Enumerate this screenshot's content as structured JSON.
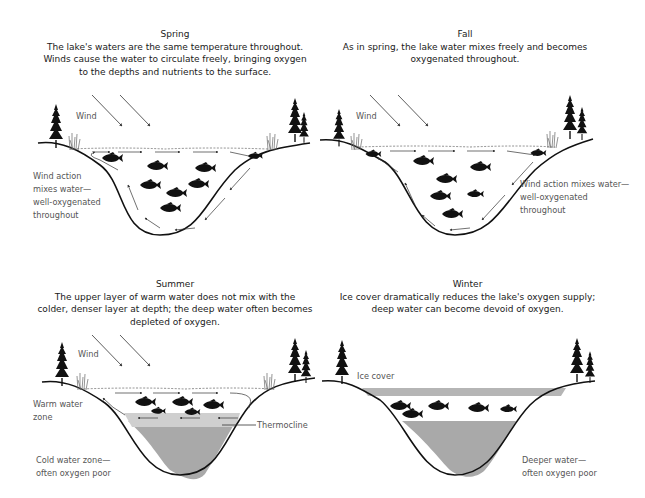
{
  "panels": {
    "spring": {
      "season": "Spring",
      "description_lines": [
        "The lake's waters are the same temperature throughout.",
        "Winds cause the water to circulate freely, bringing oxygen",
        "to the depths and nutrients to the surface."
      ],
      "wind_label": "Wind",
      "side_label_lines": [
        "Wind action",
        "mixes water—",
        "well-oxygenated",
        "throughout"
      ]
    },
    "fall": {
      "season": "Fall",
      "description_lines": [
        "As in spring, the lake water mixes freely and becomes",
        "oxygenated throughout."
      ],
      "wind_label": "Wind",
      "side_label_lines": [
        "Wind action mixes water—",
        "well-oxygenated",
        "throughout"
      ]
    },
    "summer": {
      "season": "Summer",
      "description_lines": [
        "The upper layer of warm water does not mix with the",
        "colder, denser layer at depth; the deep water often becomes",
        "depleted of oxygen."
      ],
      "wind_label": "Wind",
      "warm_label_lines": [
        "Warm water",
        "zone"
      ],
      "thermocline_label": "Thermocline",
      "cold_label_lines": [
        "Cold water zone—",
        "often oxygen poor"
      ]
    },
    "winter": {
      "season": "Winter",
      "description_lines": [
        "Ice cover dramatically reduces the lake's oxygen supply;",
        "deep water can become devoid of oxygen."
      ],
      "ice_label": "Ice cover",
      "deep_label_lines": [
        "Deeper water—",
        "often oxygen poor"
      ]
    }
  },
  "colors": {
    "ink": "#111111",
    "label": "#555555",
    "thermocline_zone": "#cfcfcf",
    "cold_zone": "#a9a9a9",
    "ice": "#b5b5b5",
    "arrow": "#333333"
  }
}
